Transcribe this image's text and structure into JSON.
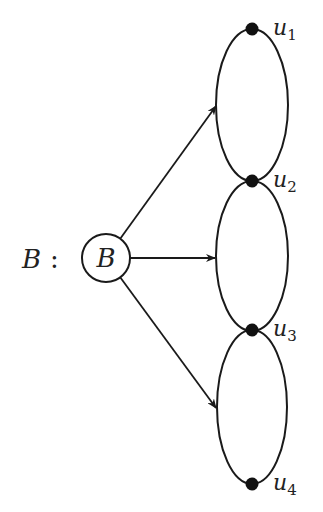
{
  "diagram": {
    "label": {
      "text": "B",
      "suffix": ":"
    },
    "source_node": {
      "id": "B",
      "label": "B",
      "cx": 106,
      "cy": 258,
      "r": 24
    },
    "vertices": [
      {
        "id": "u1",
        "name": "u",
        "sub": "1",
        "x": 252,
        "y": 29
      },
      {
        "id": "u2",
        "name": "u",
        "sub": "2",
        "x": 252,
        "y": 181
      },
      {
        "id": "u3",
        "name": "u",
        "sub": "3",
        "x": 252,
        "y": 330
      },
      {
        "id": "u4",
        "name": "u",
        "sub": "4",
        "x": 252,
        "y": 484
      }
    ],
    "ellipses": [
      {
        "between": [
          "u1",
          "u2"
        ],
        "cx": 252,
        "cy": 105,
        "rx": 36,
        "ry": 76
      },
      {
        "between": [
          "u2",
          "u3"
        ],
        "cx": 252,
        "cy": 256,
        "rx": 36,
        "ry": 75
      },
      {
        "between": [
          "u3",
          "u4"
        ],
        "cx": 252,
        "cy": 407,
        "rx": 35,
        "ry": 77
      }
    ],
    "arrows": [
      {
        "from": "B",
        "to": "ellipse-1",
        "x1": 120,
        "y1": 239,
        "x2": 216,
        "y2": 106
      },
      {
        "from": "B",
        "to": "ellipse-2",
        "x1": 130,
        "y1": 258,
        "x2": 215,
        "y2": 258
      },
      {
        "from": "B",
        "to": "ellipse-3",
        "x1": 120,
        "y1": 277,
        "x2": 216,
        "y2": 408
      }
    ],
    "colors": {
      "stroke": "#1a1a1a",
      "vertex": "#111111",
      "text": "#222222"
    }
  }
}
